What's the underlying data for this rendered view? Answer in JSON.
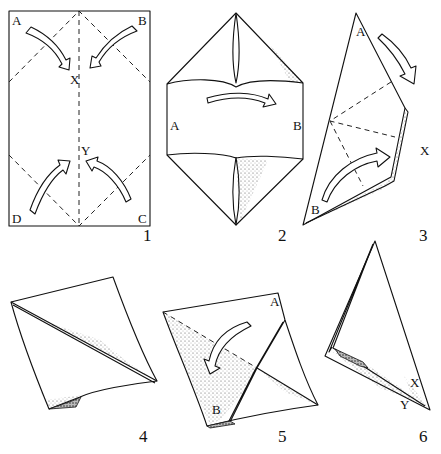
{
  "diagram": {
    "type": "origami-instructions",
    "steps": [
      {
        "number": "1",
        "labels": {
          "corner_top_left": "A",
          "corner_top_right": "B",
          "corner_bottom_right": "C",
          "corner_bottom_left": "D",
          "point_upper": "X",
          "point_lower": "Y"
        },
        "arrows": [
          "A-to-X",
          "B-to-X",
          "D-to-Y",
          "C-to-Y"
        ]
      },
      {
        "number": "2",
        "labels": {
          "left": "A",
          "right": "B"
        },
        "arrows": [
          "A-to-B"
        ]
      },
      {
        "number": "3",
        "labels": {
          "top": "A",
          "bottom": "B",
          "right": "X"
        },
        "arrows": [
          "fold-A-down",
          "fold-B-up"
        ]
      },
      {
        "number": "4",
        "labels": {},
        "arrows": []
      },
      {
        "number": "5",
        "labels": {
          "top": "A",
          "bottom": "B"
        },
        "arrows": [
          "fold-down-left"
        ]
      },
      {
        "number": "6",
        "labels": {
          "upper": "X",
          "lower": "Y"
        },
        "arrows": []
      }
    ]
  }
}
